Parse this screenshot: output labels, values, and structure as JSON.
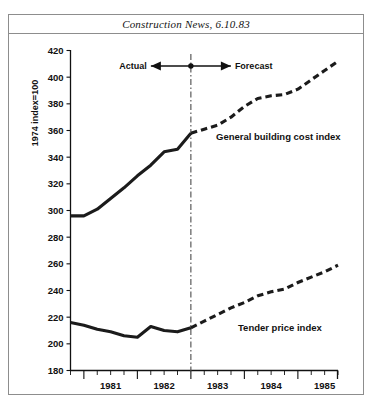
{
  "figure": {
    "title": "Construction News, 6.10.83",
    "background": "#ffffff",
    "frame_color": "#8d8d8d"
  },
  "annotations": {
    "actual_label": "Actual",
    "forecast_label": "Forecast",
    "divider_year": 1983,
    "series_label_upper": "General building cost index",
    "series_label_lower": "Tender price index"
  },
  "chart_data": {
    "type": "line",
    "title": "Construction News, 6.10.83",
    "xlabel": "",
    "ylabel": "1974 index=100",
    "xlim": [
      1980.75,
      1985.75
    ],
    "ylim": [
      180,
      420
    ],
    "ytick_labels": [
      "180",
      "200",
      "220",
      "240",
      "260",
      "280",
      "300",
      "320",
      "340",
      "360",
      "380",
      "400",
      "420"
    ],
    "yticks": [
      180,
      200,
      220,
      240,
      260,
      280,
      300,
      320,
      340,
      360,
      380,
      400,
      420
    ],
    "xtick_labels": [
      "1981",
      "1982",
      "1983",
      "1984",
      "1985"
    ],
    "xticks": [
      1981,
      1982,
      1983,
      1984,
      1985
    ],
    "minor_xticks_per_year": 4,
    "grid": false,
    "legend": "inline-annotation",
    "divider_x": 1983,
    "line_color": "#1b1b1b",
    "series": [
      {
        "name": "General building cost index",
        "style": "solid",
        "segment": "actual",
        "x": [
          1980.75,
          1981.0,
          1981.25,
          1981.5,
          1981.75,
          1982.0,
          1982.25,
          1982.5,
          1982.75,
          1983.0
        ],
        "values": [
          296,
          296,
          301,
          309,
          317,
          326,
          334,
          344,
          346,
          358
        ]
      },
      {
        "name": "General building cost index",
        "style": "dashed",
        "segment": "forecast",
        "x": [
          1983.0,
          1983.25,
          1983.5,
          1983.75,
          1984.0,
          1984.25,
          1984.5,
          1984.75,
          1985.0,
          1985.25,
          1985.5,
          1985.75
        ],
        "values": [
          358,
          361,
          364,
          370,
          378,
          384,
          386,
          387,
          391,
          398,
          405,
          412
        ]
      },
      {
        "name": "Tender price index",
        "style": "solid",
        "segment": "actual",
        "x": [
          1980.75,
          1981.0,
          1981.25,
          1981.5,
          1981.75,
          1982.0,
          1982.25,
          1982.5,
          1982.75,
          1983.0
        ],
        "values": [
          216,
          214,
          211,
          209,
          206,
          205,
          213,
          210,
          209,
          212
        ]
      },
      {
        "name": "Tender price index",
        "style": "dashed",
        "segment": "forecast",
        "x": [
          1983.0,
          1983.25,
          1983.5,
          1983.75,
          1984.0,
          1984.25,
          1984.5,
          1984.75,
          1985.0,
          1985.25,
          1985.5,
          1985.75
        ],
        "values": [
          212,
          217,
          222,
          227,
          231,
          236,
          239,
          241,
          246,
          250,
          254,
          259
        ]
      }
    ]
  }
}
